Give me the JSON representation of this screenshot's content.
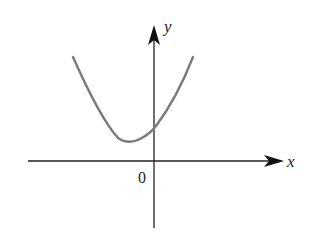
{
  "diagram": {
    "type": "function-graph",
    "axes": {
      "x_label": "x",
      "y_label": "y",
      "origin_label": "0"
    },
    "colors": {
      "axis": "#222222",
      "curve": "#7a7a7a"
    }
  }
}
